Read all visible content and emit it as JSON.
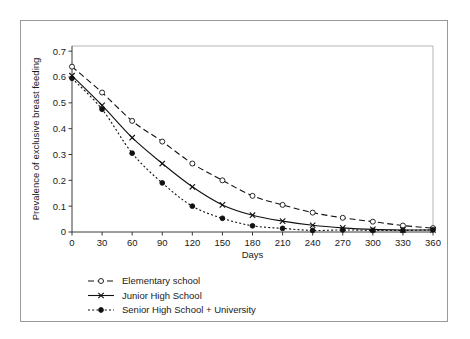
{
  "figure": {
    "has_outer_border": true,
    "background_color": "#ffffff",
    "ink_color": "#111111"
  },
  "chart_data": {
    "type": "line",
    "title": "",
    "subtitle": "",
    "xlabel": "Days",
    "ylabel": "Prevalence of exclusive breast feeding",
    "x": [
      0,
      30,
      60,
      90,
      120,
      150,
      180,
      210,
      240,
      270,
      300,
      330,
      360
    ],
    "xticklabels": [
      "0",
      "30",
      "60",
      "90",
      "120",
      "150",
      "180",
      "210",
      "240",
      "270",
      "300",
      "330",
      "360"
    ],
    "yticklabels": [
      "0",
      "0.1",
      "0.2",
      "0.3",
      "0.4",
      "0.5",
      "0.6",
      "0.7"
    ],
    "yticks": [
      0,
      0.1,
      0.2,
      0.3,
      0.4,
      0.5,
      0.6,
      0.7
    ],
    "xlim": [
      0,
      360
    ],
    "ylim": [
      0,
      0.72
    ],
    "grid": false,
    "legend_position": "below-left",
    "series": [
      {
        "name": "Elementary school",
        "marker": "open-circle",
        "linestyle": "dashed",
        "color": "#111111",
        "values": [
          0.64,
          0.54,
          0.43,
          0.35,
          0.265,
          0.2,
          0.14,
          0.105,
          0.075,
          0.055,
          0.04,
          0.025,
          0.015
        ]
      },
      {
        "name": "Junior High School",
        "marker": "cross",
        "linestyle": "solid",
        "color": "#111111",
        "values": [
          0.605,
          0.49,
          0.365,
          0.265,
          0.175,
          0.105,
          0.065,
          0.042,
          0.026,
          0.016,
          0.01,
          0.008,
          0.008
        ]
      },
      {
        "name": "Senior High School + University",
        "marker": "filled-circle",
        "linestyle": "dotted",
        "color": "#111111",
        "values": [
          0.595,
          0.475,
          0.305,
          0.19,
          0.1,
          0.053,
          0.024,
          0.014,
          0.006,
          0.008,
          0.006,
          0.006,
          0.008
        ]
      }
    ]
  },
  "legend": {
    "entries": [
      {
        "label": "Elementary school"
      },
      {
        "label": "Junior High School"
      },
      {
        "label": "Senior High School + University"
      }
    ]
  }
}
